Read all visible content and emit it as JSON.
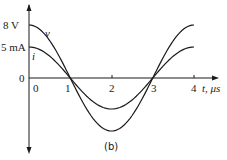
{
  "chart_data": {
    "type": "line",
    "title": "",
    "caption": "(b)",
    "xlabel": "t, μs",
    "ylabel": "",
    "x_ticks": [
      "0",
      "1",
      "2",
      "3",
      "4"
    ],
    "y_ticks": [
      "8 V",
      "5 mA",
      "0"
    ],
    "xlim": [
      0,
      4.4
    ],
    "grid": false,
    "series": [
      {
        "name": "v",
        "unit": "V",
        "amplitude": 8,
        "period_us": 4,
        "formula": "8 cos(2πt/4)",
        "x": [
          0,
          0.5,
          1,
          1.5,
          2,
          2.5,
          3,
          3.5,
          4
        ],
        "values": [
          8,
          5.66,
          0,
          -5.66,
          -8,
          -5.66,
          0,
          5.66,
          8
        ]
      },
      {
        "name": "i",
        "unit": "mA",
        "amplitude": 5,
        "period_us": 4,
        "formula": "5 cos(2πt/4)",
        "x": [
          0,
          0.5,
          1,
          1.5,
          2,
          2.5,
          3,
          3.5,
          4
        ],
        "values": [
          5,
          3.54,
          0,
          -3.54,
          -5,
          -3.54,
          0,
          3.54,
          5
        ]
      }
    ]
  },
  "labels": {
    "v_amp": "8 V",
    "i_amp": "5 mA",
    "y_zero": "0",
    "v_name": "v",
    "i_name": "i",
    "t0": "0",
    "t1": "1",
    "t2": "2",
    "t3": "3",
    "t4": "4",
    "x_axis": "t, μs",
    "caption": "(b)"
  }
}
